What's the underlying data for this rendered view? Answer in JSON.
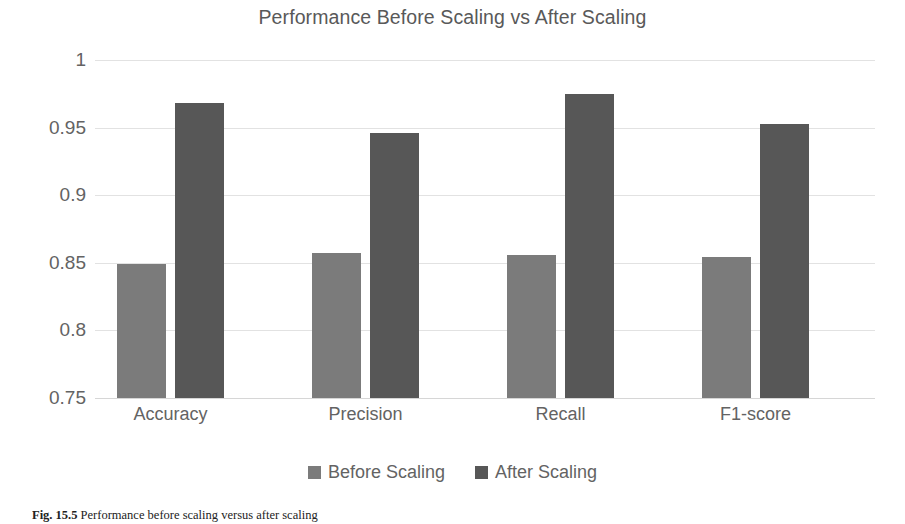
{
  "chart_data": {
    "type": "bar",
    "title": "Performance Before Scaling vs After Scaling",
    "xlabel": "",
    "ylabel": "",
    "categories": [
      "Accuracy",
      "Precision",
      "Recall",
      "F1-score"
    ],
    "series": [
      {
        "name": "Before Scaling",
        "color": "#7b7b7b",
        "values": [
          0.849,
          0.857,
          0.856,
          0.854
        ]
      },
      {
        "name": "After Scaling",
        "color": "#575757",
        "values": [
          0.968,
          0.946,
          0.975,
          0.953
        ]
      }
    ],
    "ylim": [
      0.75,
      1
    ],
    "yticks": [
      1,
      0.95,
      0.9,
      0.85,
      0.8,
      0.75
    ],
    "ytick_labels": [
      "1",
      "0.95",
      "0.9",
      "0.85",
      "0.8",
      "0.75"
    ],
    "grid": true,
    "legend_position": "bottom"
  },
  "caption": {
    "label": "Fig. 15.5",
    "text": "Performance before scaling versus after scaling"
  },
  "colors": {
    "before": "#7b7b7b",
    "after": "#575757",
    "gridline": "#e2e2e2",
    "text": "#636363",
    "title": "#595959"
  }
}
